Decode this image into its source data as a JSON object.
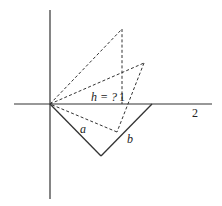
{
  "diagram": {
    "labels": {
      "h": "h = ?",
      "one": "1",
      "two": "2",
      "a": "a",
      "b": "b"
    },
    "colors": {
      "stroke": "#333333",
      "background": "#ffffff"
    }
  }
}
